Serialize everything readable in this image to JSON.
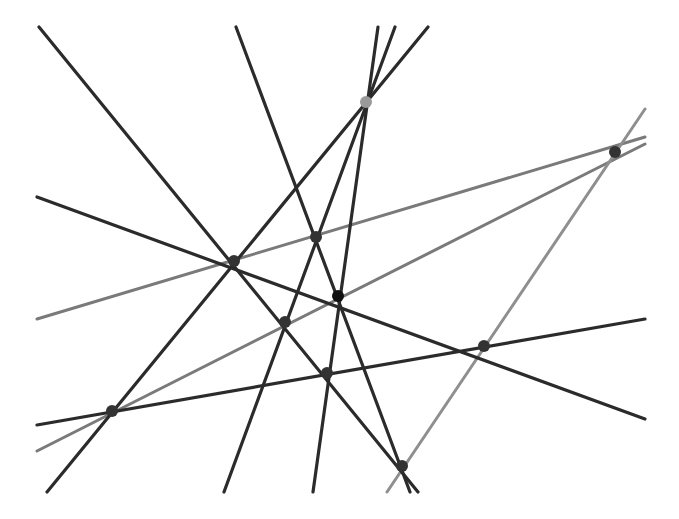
{
  "diagram": {
    "width": 679,
    "height": 519,
    "background": "#ffffff",
    "colors": {
      "dark_line": "#2b2b2b",
      "gray_line": "#7a7a7a",
      "light_gray_line": "#8f8f8f",
      "dark_point": "#333333",
      "black_point": "#111111",
      "light_point": "#9a9a9a"
    },
    "lines": [
      {
        "id": "L1",
        "color": "dark",
        "x1": 39,
        "y1": 27,
        "x2": 418,
        "y2": 492
      },
      {
        "id": "L2",
        "color": "dark",
        "x1": 236,
        "y1": 27,
        "x2": 410,
        "y2": 492
      },
      {
        "id": "L3",
        "color": "dark",
        "x1": 37,
        "y1": 197,
        "x2": 645,
        "y2": 419
      },
      {
        "id": "L4",
        "color": "dark",
        "x1": 428,
        "y1": 27,
        "x2": 47,
        "y2": 492
      },
      {
        "id": "L5",
        "color": "dark",
        "x1": 395,
        "y1": 27,
        "x2": 224,
        "y2": 492
      },
      {
        "id": "L6",
        "color": "dark",
        "x1": 378,
        "y1": 27,
        "x2": 313,
        "y2": 492
      },
      {
        "id": "L7",
        "color": "dark",
        "x1": 37,
        "y1": 425,
        "x2": 645,
        "y2": 319
      },
      {
        "id": "L8",
        "color": "gray",
        "x1": 37,
        "y1": 319,
        "x2": 645,
        "y2": 137
      },
      {
        "id": "L9",
        "color": "gray",
        "x1": 37,
        "y1": 451,
        "x2": 645,
        "y2": 144
      },
      {
        "id": "L10",
        "color": "light_gray",
        "x1": 645,
        "y1": 109,
        "x2": 387,
        "y2": 492
      }
    ],
    "points": [
      {
        "id": "A",
        "cx": 234,
        "cy": 261,
        "r": 6,
        "color": "dark"
      },
      {
        "id": "B",
        "cx": 316,
        "cy": 237,
        "r": 6,
        "color": "dark"
      },
      {
        "id": "C",
        "cx": 338,
        "cy": 296,
        "r": 6,
        "color": "black"
      },
      {
        "id": "D",
        "cx": 285,
        "cy": 322,
        "r": 6,
        "color": "dark"
      },
      {
        "id": "E",
        "cx": 327,
        "cy": 373,
        "r": 6,
        "color": "dark"
      },
      {
        "id": "F",
        "cx": 484,
        "cy": 346,
        "r": 6,
        "color": "dark"
      },
      {
        "id": "G",
        "cx": 112,
        "cy": 411,
        "r": 6,
        "color": "dark"
      },
      {
        "id": "H",
        "cx": 402,
        "cy": 466,
        "r": 6,
        "color": "dark"
      },
      {
        "id": "P",
        "cx": 366,
        "cy": 102,
        "r": 6,
        "color": "light"
      },
      {
        "id": "Q",
        "cx": 615,
        "cy": 152,
        "r": 6,
        "color": "dark"
      }
    ]
  }
}
